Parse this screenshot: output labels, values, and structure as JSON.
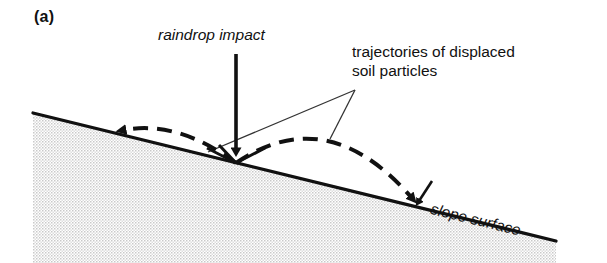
{
  "figure": {
    "panel_label": "(a)",
    "caption_labels": {
      "raindrop": "raindrop impact",
      "trajectories_line1": "trajectories of displaced",
      "trajectories_line2": "soil particles",
      "slope": "slope surface"
    }
  },
  "colors": {
    "ink": "#111111",
    "soil_fill": "#e3e3e3",
    "background": "#ffffff"
  },
  "diagram": {
    "type": "schematic",
    "slope": {
      "start_x": 33,
      "start_y": 113,
      "end_x": 556,
      "end_y": 241,
      "angle_deg": 13.8
    },
    "impact_point": {
      "x": 236,
      "y": 163
    },
    "raindrop_arrow": {
      "from_x": 236,
      "from_y": 54,
      "to_x": 236,
      "to_y": 163
    },
    "uphill_trajectory": {
      "label": "short uphill displacement",
      "from_x": 236,
      "from_y": 163,
      "apex_x": 172,
      "apex_y": 128,
      "to_x": 116,
      "to_y": 131
    },
    "downhill_trajectory": {
      "label": "long downhill displacement",
      "from_x": 236,
      "from_y": 163,
      "apex_x": 325,
      "apex_y": 127,
      "to_x": 419,
      "to_y": 206
    },
    "leader_lines": [
      {
        "from_x": 355,
        "from_y": 90,
        "to_x": 208,
        "to_y": 152
      },
      {
        "from_x": 355,
        "from_y": 90,
        "to_x": 330,
        "to_y": 139
      }
    ]
  }
}
